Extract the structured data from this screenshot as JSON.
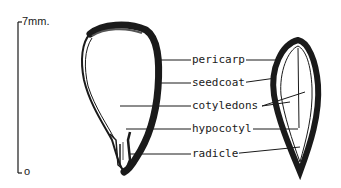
{
  "diagram": {
    "type": "seed cross-section",
    "scale": {
      "top_label": "7mm.",
      "bottom_label": "o"
    },
    "labels": [
      {
        "id": "pericarp",
        "text": "pericarp"
      },
      {
        "id": "seedcoat",
        "text": "seedcoat"
      },
      {
        "id": "cotyledons",
        "text": "cotyledons"
      },
      {
        "id": "hypocotyl",
        "text": "hypocotyl"
      },
      {
        "id": "radicle",
        "text": "radicle"
      }
    ],
    "views": [
      {
        "id": "left-seed",
        "description": "longitudinal section, face view"
      },
      {
        "id": "right-seed",
        "description": "longitudinal section, edge view"
      }
    ],
    "colors": {
      "ink": "#1a1a1a",
      "background": "#ffffff"
    }
  }
}
